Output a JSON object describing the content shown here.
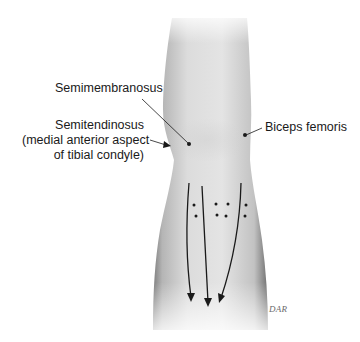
{
  "figure": {
    "colors": {
      "background": "#ffffff",
      "skin_light": "#f2f2f2",
      "skin_mid": "#d4d4d4",
      "skin_dark": "#8a8a8a",
      "ink": "#1a1a1a"
    }
  },
  "labels": {
    "semimembranosus": "Semimembranosus",
    "semitendinosus": {
      "line1": "Semitendinosus",
      "line2": "(medial anterior aspect",
      "line3": "of tibial condyle)"
    },
    "biceps_femoris": "Biceps femoris"
  },
  "markers": {
    "insertion_points": [
      {
        "name": "semimembranosus",
        "x": 189,
        "y": 144
      },
      {
        "name": "semitendinosus",
        "x": 171,
        "y": 146
      },
      {
        "name": "biceps-femoris",
        "x": 245,
        "y": 135
      }
    ],
    "dot_grid": [
      {
        "x": 194,
        "y": 205
      },
      {
        "x": 196,
        "y": 216
      },
      {
        "x": 216,
        "y": 204
      },
      {
        "x": 228,
        "y": 204
      },
      {
        "x": 217,
        "y": 215
      },
      {
        "x": 226,
        "y": 216
      },
      {
        "x": 246,
        "y": 205
      },
      {
        "x": 245,
        "y": 216
      }
    ],
    "arrow_count": 3
  },
  "signature": "DAR"
}
